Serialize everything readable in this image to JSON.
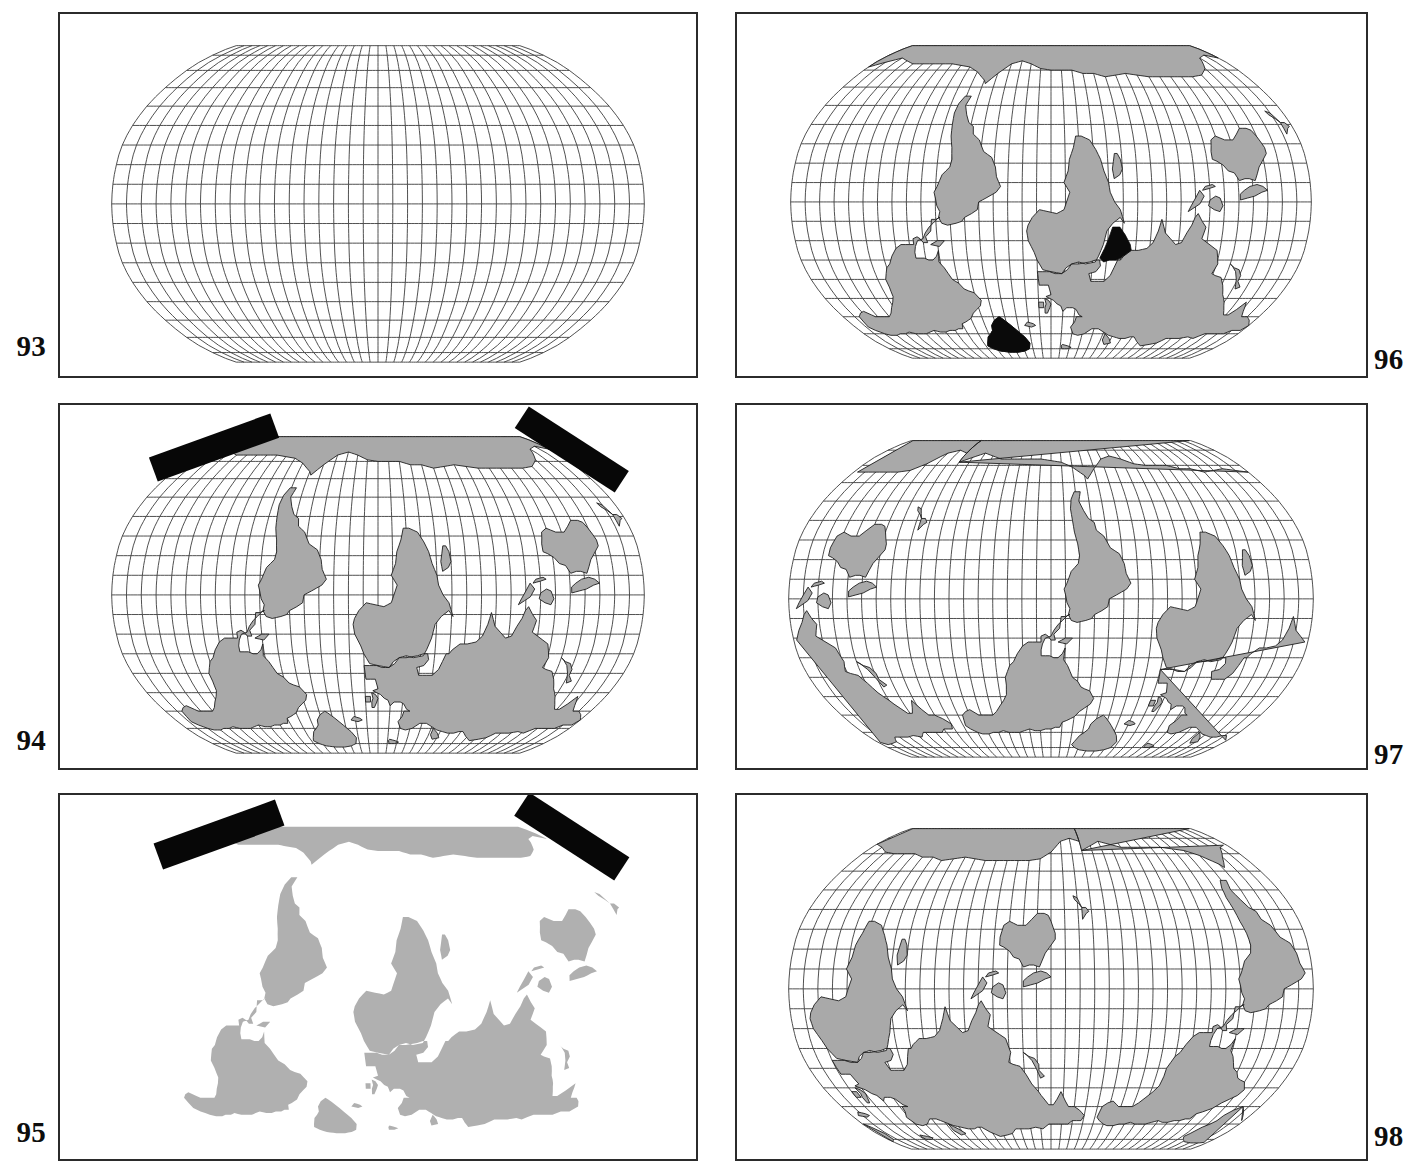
{
  "page": {
    "width": 1405,
    "height": 1176,
    "background_color": "#ffffff",
    "ink_color": "#2b2b2b",
    "land_fill_color": "#a9a9a9",
    "highlight_fill_color": "#0a0a0a",
    "graticule_color": "#3c3c3c",
    "columns": 2,
    "rows": 3
  },
  "figures": [
    {
      "id": "fig-93",
      "number": "93",
      "number_side": "left",
      "row": 1,
      "column": 1,
      "has_graticule": true,
      "has_land": false,
      "has_black_bars": false,
      "highlighted_regions": [],
      "center_longitude": 0,
      "graticule_interval_deg": 10,
      "description": "Empty graticule only, pseudocylindrical projection, no coastlines"
    },
    {
      "id": "fig-96",
      "number": "96",
      "number_side": "right",
      "row": 1,
      "column": 2,
      "has_graticule": true,
      "has_land": true,
      "has_black_bars": false,
      "highlighted_regions": [
        "Greenland",
        "Arabian Peninsula"
      ],
      "center_longitude": 0,
      "graticule_interval_deg": 10,
      "description": "World map centered on 0 degrees with Greenland and the Arabian Peninsula filled black"
    },
    {
      "id": "fig-94",
      "number": "94",
      "number_side": "left",
      "row": 2,
      "column": 1,
      "has_graticule": true,
      "has_land": true,
      "has_black_bars": true,
      "highlighted_regions": [],
      "center_longitude": 0,
      "graticule_interval_deg": 10,
      "description": "World map centered on 0 degrees with two black marker bars over high northern latitudes"
    },
    {
      "id": "fig-97",
      "number": "97",
      "number_side": "right",
      "row": 2,
      "column": 2,
      "has_graticule": true,
      "has_land": true,
      "has_black_bars": false,
      "highlighted_regions": [],
      "center_longitude": -90,
      "graticule_interval_deg": 10,
      "description": "World map centered on the Americas, 90 degrees west"
    },
    {
      "id": "fig-95",
      "number": "95",
      "number_side": "left",
      "row": 3,
      "column": 1,
      "has_graticule": false,
      "has_land": true,
      "has_black_bars": true,
      "highlighted_regions": [],
      "center_longitude": 0,
      "graticule_interval_deg": 0,
      "description": "World map silhouette with no graticule and two black marker bars"
    },
    {
      "id": "fig-98",
      "number": "98",
      "number_side": "right",
      "row": 3,
      "column": 2,
      "has_graticule": true,
      "has_land": true,
      "has_black_bars": false,
      "highlighted_regions": [],
      "center_longitude": 150,
      "graticule_interval_deg": 10,
      "description": "World map centered on the Pacific, 150 degrees east"
    }
  ],
  "chart_data": {
    "type": "map",
    "panels": [
      {
        "label": "93",
        "central_meridian": 0,
        "graticule": true,
        "coastlines": false,
        "annotation_bars": 0,
        "black_regions": 0
      },
      {
        "label": "96",
        "central_meridian": 0,
        "graticule": true,
        "coastlines": true,
        "annotation_bars": 0,
        "black_regions": 2
      },
      {
        "label": "94",
        "central_meridian": 0,
        "graticule": true,
        "coastlines": true,
        "annotation_bars": 2,
        "black_regions": 0
      },
      {
        "label": "97",
        "central_meridian": -90,
        "graticule": true,
        "coastlines": true,
        "annotation_bars": 0,
        "black_regions": 0
      },
      {
        "label": "95",
        "central_meridian": 0,
        "graticule": false,
        "coastlines": true,
        "annotation_bars": 2,
        "black_regions": 0
      },
      {
        "label": "98",
        "central_meridian": 150,
        "graticule": true,
        "coastlines": true,
        "annotation_bars": 0,
        "black_regions": 0
      }
    ],
    "graticule_interval_deg": 10,
    "latitude_range": [
      -90,
      90
    ],
    "longitude_range": [
      -180,
      180
    ],
    "legend": "none",
    "grid": true
  }
}
